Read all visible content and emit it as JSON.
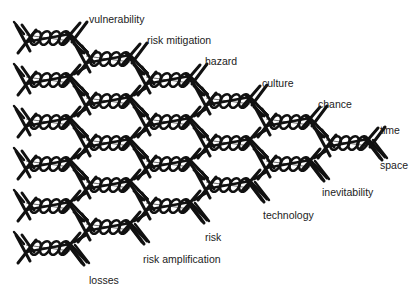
{
  "diagram": {
    "type": "twisted-wire lattice (barbed-wire style network)",
    "colors": {
      "wire": "#111111",
      "background": "#ffffff",
      "text": "#222222"
    },
    "columns": [
      {
        "x0": 18,
        "x1": 78,
        "rows": [
          38,
          80,
          122,
          164,
          206,
          248
        ]
      },
      {
        "x0": 78,
        "x1": 138,
        "rows": [
          59,
          101,
          143,
          185,
          227
        ]
      },
      {
        "x0": 138,
        "x1": 198,
        "rows": [
          80,
          122,
          164,
          206
        ]
      },
      {
        "x0": 198,
        "x1": 258,
        "rows": [
          101,
          143,
          185
        ]
      },
      {
        "x0": 258,
        "x1": 318,
        "rows": [
          122,
          164
        ]
      },
      {
        "x0": 318,
        "x1": 376,
        "rows": [
          143
        ]
      }
    ],
    "upper_labels": [
      {
        "text": "vulnerability",
        "x": 89,
        "y": 14
      },
      {
        "text": "risk mitigation",
        "x": 147,
        "y": 35
      },
      {
        "text": "hazard",
        "x": 205,
        "y": 56
      },
      {
        "text": "culture",
        "x": 262,
        "y": 78
      },
      {
        "text": "chance",
        "x": 318,
        "y": 99
      },
      {
        "text": "time",
        "x": 380,
        "y": 125
      }
    ],
    "lower_labels": [
      {
        "text": "space",
        "x": 380,
        "y": 160
      },
      {
        "text": "inevitability",
        "x": 322,
        "y": 187
      },
      {
        "text": "technology",
        "x": 263,
        "y": 210
      },
      {
        "text": "risk",
        "x": 205,
        "y": 232
      },
      {
        "text": "risk amplification",
        "x": 143,
        "y": 254
      },
      {
        "text": "losses",
        "x": 89,
        "y": 275
      }
    ]
  }
}
